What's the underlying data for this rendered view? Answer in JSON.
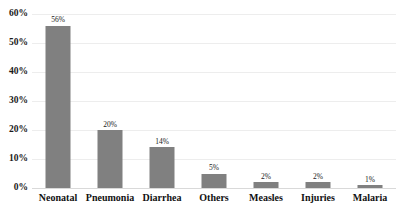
{
  "chart_data": {
    "type": "bar",
    "title": "",
    "subtitle": "",
    "xlabel": "",
    "ylabel": "",
    "categories": [
      "Neonatal",
      "Pneumonia",
      "Diarrhea",
      "Others",
      "Measles",
      "Injuries",
      "Malaria"
    ],
    "values": [
      56,
      20,
      14,
      5,
      2,
      2,
      1
    ],
    "data_labels": [
      "56%",
      "20%",
      "14%",
      "5%",
      "2%",
      "2%",
      "1%"
    ],
    "ylim": [
      0,
      60
    ],
    "ytick_values": [
      0,
      10,
      20,
      30,
      40,
      50,
      60
    ],
    "ytick_labels": [
      "0%",
      "10%",
      "20%",
      "30%",
      "40%",
      "50%",
      "60%"
    ],
    "grid": true,
    "grid_axis": "y",
    "legend": false,
    "legend_position": "none",
    "bar_color": "#808080",
    "gridline_color": "#ededed",
    "axis_color": "#d9d9d9",
    "background_color": "#ffffff",
    "text_color": "#1a1a1a"
  }
}
